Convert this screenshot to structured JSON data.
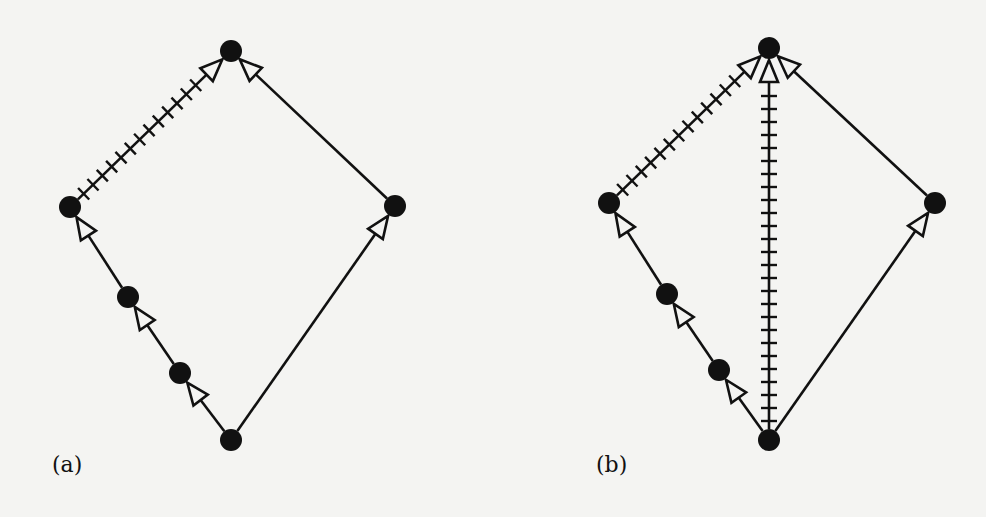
{
  "figure": {
    "background": "#f4f4f2",
    "ink": "#111111",
    "panels": [
      {
        "id": "a",
        "label": "(a)",
        "label_pos": [
          52,
          452
        ],
        "nodes": {
          "top": [
            231,
            51
          ],
          "left": [
            70,
            207
          ],
          "right": [
            395,
            206
          ],
          "mid1": [
            128,
            297
          ],
          "mid2": [
            180,
            373
          ],
          "bottom": [
            231,
            440
          ]
        },
        "edges": [
          {
            "from": "bottom",
            "to": "mid2",
            "style": "solid",
            "arrow": true
          },
          {
            "from": "mid2",
            "to": "mid1",
            "style": "solid",
            "arrow": true
          },
          {
            "from": "mid1",
            "to": "left",
            "style": "solid",
            "arrow": true
          },
          {
            "from": "left",
            "to": "top",
            "style": "ticked",
            "arrow": true
          },
          {
            "from": "bottom",
            "to": "right",
            "style": "solid",
            "arrow": true
          },
          {
            "from": "right",
            "to": "top",
            "style": "solid",
            "arrow": true
          }
        ]
      },
      {
        "id": "b",
        "label": "(b)",
        "label_pos": [
          596,
          452
        ],
        "nodes": {
          "top": [
            769,
            48
          ],
          "left": [
            609,
            203
          ],
          "right": [
            935,
            203
          ],
          "mid1": [
            667,
            294
          ],
          "mid2": [
            719,
            370
          ],
          "bottom": [
            769,
            440
          ]
        },
        "edges": [
          {
            "from": "bottom",
            "to": "mid2",
            "style": "solid",
            "arrow": true
          },
          {
            "from": "mid2",
            "to": "mid1",
            "style": "solid",
            "arrow": true
          },
          {
            "from": "mid1",
            "to": "left",
            "style": "solid",
            "arrow": true
          },
          {
            "from": "left",
            "to": "top",
            "style": "ticked",
            "arrow": true
          },
          {
            "from": "bottom",
            "to": "top",
            "style": "ticked",
            "arrow": true
          },
          {
            "from": "bottom",
            "to": "right",
            "style": "solid",
            "arrow": true
          },
          {
            "from": "right",
            "to": "top",
            "style": "solid",
            "arrow": true
          }
        ]
      }
    ]
  }
}
